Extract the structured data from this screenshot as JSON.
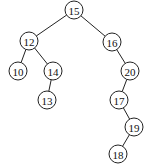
{
  "diagram": {
    "type": "binary-search-tree",
    "nodes": [
      {
        "id": "n15",
        "label": "15",
        "x": 74,
        "y": 10
      },
      {
        "id": "n12",
        "label": "12",
        "x": 29,
        "y": 41
      },
      {
        "id": "n16",
        "label": "16",
        "x": 112,
        "y": 42
      },
      {
        "id": "n10",
        "label": "10",
        "x": 18,
        "y": 71
      },
      {
        "id": "n14",
        "label": "14",
        "x": 53,
        "y": 71
      },
      {
        "id": "n20",
        "label": "20",
        "x": 130,
        "y": 71
      },
      {
        "id": "n13",
        "label": "13",
        "x": 47,
        "y": 100
      },
      {
        "id": "n17",
        "label": "17",
        "x": 119,
        "y": 100
      },
      {
        "id": "n19",
        "label": "19",
        "x": 134,
        "y": 127
      },
      {
        "id": "n18",
        "label": "18",
        "x": 118,
        "y": 154
      }
    ],
    "edges": [
      {
        "from": "n15",
        "to": "n12"
      },
      {
        "from": "n15",
        "to": "n16"
      },
      {
        "from": "n12",
        "to": "n10"
      },
      {
        "from": "n12",
        "to": "n14"
      },
      {
        "from": "n14",
        "to": "n13"
      },
      {
        "from": "n16",
        "to": "n20"
      },
      {
        "from": "n20",
        "to": "n17"
      },
      {
        "from": "n17",
        "to": "n19"
      },
      {
        "from": "n19",
        "to": "n18"
      }
    ]
  }
}
